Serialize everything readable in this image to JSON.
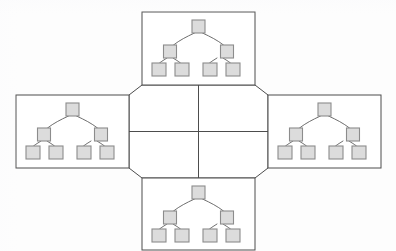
{
  "diagram": {
    "type": "unfolded-cube-net",
    "background_color": "#fdfdfd",
    "outline_color": "#4d4d4d",
    "node_fill_color": "#dcdcdc",
    "node_stroke_color": "#8c8c8c",
    "edge_color": "#6e6e6e",
    "face_count": 6,
    "tree_face_count": 4,
    "blank_face_count": 2,
    "center_shape": "octagon",
    "tree": {
      "levels": 3,
      "node_count": 7,
      "root_count": 1,
      "level_2_count": 2,
      "level_3_count": 4,
      "node_shape": "square",
      "node_size_px": 13
    },
    "faces": [
      {
        "id": "top-face",
        "label": "Top face",
        "position": "top",
        "has_tree": true,
        "x": 142,
        "y": 12,
        "width": 113,
        "height": 73
      },
      {
        "id": "left-face",
        "label": "Left face",
        "position": "left",
        "has_tree": true,
        "x": 16,
        "y": 95,
        "width": 113,
        "height": 73
      },
      {
        "id": "right-face",
        "label": "Right face",
        "position": "right",
        "has_tree": true,
        "x": 268,
        "y": 95,
        "width": 113,
        "height": 73
      },
      {
        "id": "bottom-face",
        "label": "Bottom face",
        "position": "bottom",
        "has_tree": true,
        "x": 142,
        "y": 178,
        "width": 113,
        "height": 73
      },
      {
        "id": "center-upper-face",
        "label": "Center upper face",
        "position": "center-upper",
        "has_tree": false
      },
      {
        "id": "center-lower-face",
        "label": "Center lower face",
        "position": "center-lower",
        "has_tree": false
      }
    ]
  }
}
